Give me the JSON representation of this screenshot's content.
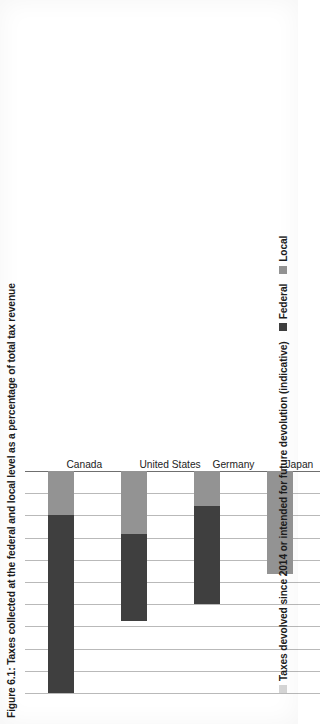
{
  "figure": {
    "title": "Figure 6.1: Taxes collected at the federal and local level as a percentage of total tax revenue"
  },
  "legend": {
    "position": "bottom",
    "items": [
      {
        "label": "Local",
        "color": "#939393"
      },
      {
        "label": "Federal",
        "color": "#3f3f3f"
      },
      {
        "label": "Taxes devolved since 2014 or intended for future devolution (indicative)",
        "color": "#d5d5d5"
      }
    ]
  },
  "axis": {
    "tick_labels": [
      "0%",
      "5%",
      "10%",
      "15%",
      "20%",
      "25%",
      "30%",
      "35%",
      "40%",
      "45%",
      "50%"
    ]
  },
  "chart_data": {
    "type": "bar",
    "orientation": "vertical-bars-rotated-page",
    "title": "Figure 6.1: Taxes collected at the federal and local level as a percentage of total tax revenue",
    "xlabel": "",
    "ylabel": "",
    "ylim": [
      0,
      50
    ],
    "ytick_step": 5,
    "grid": true,
    "legend_position": "bottom",
    "categories": [
      "Canada",
      "United States",
      "Germany",
      "Japan",
      "Italy",
      "France",
      "United Kingdom"
    ],
    "series": [
      {
        "name": "Local",
        "color": "#939393",
        "values": [
          10.0,
          14.3,
          7.8,
          23.3,
          16.3,
          13.0,
          5.0
        ]
      },
      {
        "name": "Federal",
        "color": "#3f3f3f",
        "values": [
          40.0,
          19.4,
          22.2,
          0,
          0,
          0,
          0
        ]
      },
      {
        "name": "Taxes devolved since 2014 or intended for future devolution (indicative)",
        "color": "#d5d5d5",
        "values": [
          0,
          0,
          0,
          0,
          0,
          0,
          7.5
        ]
      }
    ],
    "totals": [
      50.0,
      33.7,
      30.0,
      23.3,
      16.3,
      13.0,
      12.5
    ]
  }
}
